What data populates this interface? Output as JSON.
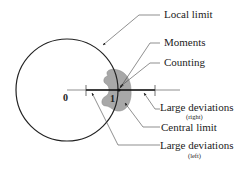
{
  "labels": {
    "local_limit": "Local limit",
    "moments": "Moments",
    "counting": "Counting",
    "large_dev_right": "Large deviations",
    "large_dev_right_sub": "(right)",
    "central_limit": "Central limit",
    "large_dev_left": "Large deviations",
    "large_dev_left_sub": "(left)"
  },
  "axis": {
    "origin": "0",
    "one": "1"
  },
  "colors": {
    "line": "#222222",
    "blob_fill": "#a8a8a8",
    "leader": "#444444"
  }
}
